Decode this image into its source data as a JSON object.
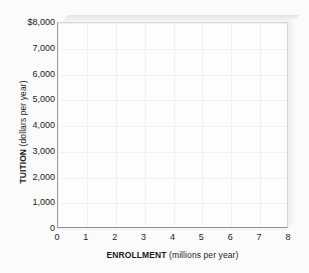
{
  "chart_data": {
    "type": "scatter",
    "title": "",
    "subtitle": "",
    "xlabel_bold": "ENROLLMENT",
    "xlabel_regular": "(millions per year)",
    "ylabel_bold": "TUITION",
    "ylabel_regular": "(dollars per year)",
    "x_tick_labels": [
      "0",
      "1",
      "2",
      "3",
      "4",
      "5",
      "6",
      "7",
      "8"
    ],
    "x_tick_values": [
      0,
      1,
      2,
      3,
      4,
      5,
      6,
      7,
      8
    ],
    "y_tick_labels": [
      "$8,000",
      "7,000",
      "6,000",
      "5,000",
      "4,000",
      "3,000",
      "2,000",
      "1,000",
      "0"
    ],
    "y_tick_values": [
      8000,
      7000,
      6000,
      5000,
      4000,
      3000,
      2000,
      1000,
      0
    ],
    "xlim": [
      0,
      8
    ],
    "ylim": [
      0,
      8000
    ],
    "grid": true,
    "legend": null,
    "series": [],
    "annotations": [],
    "note": "Blank plotting grid — no data points, lines or bars are drawn.",
    "colors": {
      "background": "#fbfbfb",
      "plot_background": "#fdfdfd",
      "gridline": "#f1f1f1",
      "axis_line": "#8e8e8e",
      "text": "#1b1b1b",
      "bevel_top": "#e3e3e3",
      "bevel_right": "#ececec"
    }
  }
}
